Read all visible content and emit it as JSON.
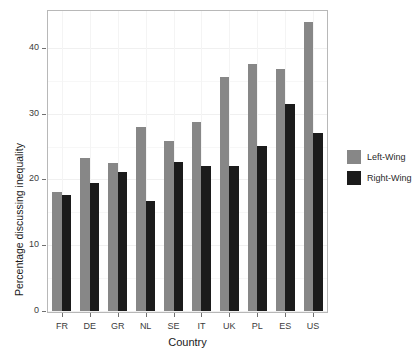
{
  "chart_data": {
    "type": "bar",
    "title": "",
    "xlabel": "Country",
    "ylabel": "Percentage discussing inequality",
    "categories": [
      "FR",
      "DE",
      "GR",
      "NL",
      "SE",
      "IT",
      "UK",
      "PL",
      "ES",
      "US"
    ],
    "series": [
      {
        "name": "Left-Wing",
        "color": "#878787",
        "values": [
          18.1,
          23.2,
          22.5,
          27.9,
          25.8,
          28.8,
          35.6,
          37.6,
          36.8,
          44.0
        ]
      },
      {
        "name": "Right-Wing",
        "color": "#1b1b1b",
        "values": [
          17.7,
          19.5,
          21.2,
          16.8,
          22.7,
          22.0,
          22.0,
          25.1,
          31.4,
          27.0
        ]
      }
    ],
    "ylim": [
      0,
      45
    ],
    "yticks": [
      0,
      10,
      20,
      30,
      40
    ],
    "ytick_labels": [
      "0",
      "10",
      "20",
      "30",
      "40"
    ],
    "grid": true,
    "legend_position": "right",
    "legend_entries": [
      "Left-Wing",
      "Right-Wing"
    ]
  }
}
